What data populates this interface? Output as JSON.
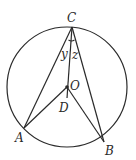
{
  "diagram": {
    "type": "circle-geometry",
    "circle": {
      "center": "O"
    },
    "points": [
      {
        "name": "C",
        "label": "C"
      },
      {
        "name": "O",
        "label": "O"
      },
      {
        "name": "D",
        "label": "D"
      },
      {
        "name": "A",
        "label": "A"
      },
      {
        "name": "B",
        "label": "B"
      }
    ],
    "segments": [
      "CA",
      "CB",
      "CD",
      "OA",
      "OB"
    ],
    "angle_labels": [
      {
        "label": "y",
        "between": [
          "CA",
          "CD"
        ]
      },
      {
        "label": "z",
        "between": [
          "CD",
          "CB"
        ]
      }
    ],
    "stroke_color": "#2a2a2a"
  }
}
